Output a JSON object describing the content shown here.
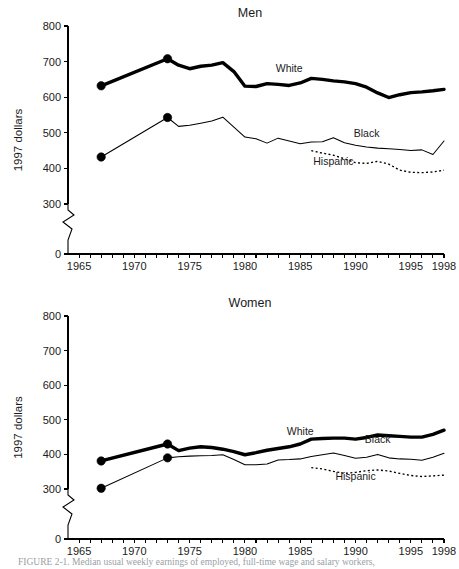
{
  "figure": {
    "caption": "FIGURE 2-1.  Median usual weekly earnings of employed, full-time wage and salary workers,"
  },
  "chart_data": [
    {
      "type": "line",
      "title": "Men",
      "xlabel": "",
      "ylabel": "1997 dollars",
      "xlim": [
        1964,
        1998
      ],
      "ylim": [
        0,
        800
      ],
      "yticks": [
        0,
        300,
        400,
        500,
        600,
        700,
        800
      ],
      "ytick_labels": [
        "0",
        "300",
        "400",
        "500",
        "600",
        "700",
        "800"
      ],
      "y_axis_break": true,
      "y_axis_break_between": [
        0,
        300
      ],
      "xticks": [
        1965,
        1966,
        1967,
        1968,
        1969,
        1970,
        1971,
        1972,
        1973,
        1974,
        1975,
        1976,
        1977,
        1978,
        1979,
        1980,
        1981,
        1982,
        1983,
        1984,
        1985,
        1986,
        1987,
        1988,
        1989,
        1990,
        1991,
        1992,
        1993,
        1994,
        1995,
        1996,
        1997,
        1998
      ],
      "xtick_labels_shown": [
        "1965",
        "1970",
        "1975",
        "1980",
        "1985",
        "1990",
        "1995",
        "1998"
      ],
      "grid": false,
      "legend_position": "inline-annotations",
      "series": [
        {
          "name": "White",
          "style": "thick-solid",
          "label_x": 1984,
          "label_y": 672,
          "markers_at": [
            1967,
            1973
          ],
          "x": [
            1967,
            1973,
            1974,
            1975,
            1976,
            1977,
            1978,
            1979,
            1980,
            1981,
            1982,
            1983,
            1984,
            1985,
            1986,
            1987,
            1988,
            1989,
            1990,
            1991,
            1992,
            1993,
            1994,
            1995,
            1996,
            1997,
            1998
          ],
          "values": [
            632,
            708,
            690,
            680,
            687,
            690,
            697,
            672,
            631,
            630,
            638,
            636,
            633,
            640,
            653,
            650,
            646,
            643,
            638,
            628,
            612,
            599,
            607,
            613,
            615,
            618,
            622
          ]
        },
        {
          "name": "Black",
          "style": "thin-solid",
          "label_x": 1991,
          "label_y": 487,
          "markers_at": [
            1967,
            1973
          ],
          "x": [
            1967,
            1973,
            1974,
            1975,
            1976,
            1977,
            1978,
            1979,
            1980,
            1981,
            1982,
            1983,
            1984,
            1985,
            1986,
            1987,
            1988,
            1989,
            1990,
            1991,
            1992,
            1993,
            1994,
            1995,
            1996,
            1997,
            1998
          ],
          "values": [
            432,
            543,
            518,
            521,
            527,
            533,
            544,
            516,
            488,
            483,
            471,
            485,
            477,
            469,
            474,
            475,
            486,
            472,
            465,
            460,
            457,
            455,
            453,
            450,
            452,
            439,
            477
          ]
        },
        {
          "name": "Hispanic",
          "style": "dotted",
          "label_x": 1988,
          "label_y": 410,
          "markers_at": [],
          "x": [
            1986,
            1987,
            1988,
            1989,
            1990,
            1991,
            1992,
            1993,
            1994,
            1995,
            1996,
            1997,
            1998
          ],
          "values": [
            450,
            443,
            437,
            427,
            416,
            414,
            420,
            412,
            395,
            389,
            388,
            390,
            395
          ]
        }
      ]
    },
    {
      "type": "line",
      "title": "Women",
      "xlabel": "",
      "ylabel": "1997 dollars",
      "xlim": [
        1964,
        1998
      ],
      "ylim": [
        0,
        800
      ],
      "yticks": [
        0,
        300,
        400,
        500,
        600,
        700,
        800
      ],
      "ytick_labels": [
        "0",
        "300",
        "400",
        "500",
        "600",
        "700",
        "800"
      ],
      "y_axis_break": true,
      "y_axis_break_between": [
        0,
        300
      ],
      "xticks": [
        1965,
        1966,
        1967,
        1968,
        1969,
        1970,
        1971,
        1972,
        1973,
        1974,
        1975,
        1976,
        1977,
        1978,
        1979,
        1980,
        1981,
        1982,
        1983,
        1984,
        1985,
        1986,
        1987,
        1988,
        1989,
        1990,
        1991,
        1992,
        1993,
        1994,
        1995,
        1996,
        1997,
        1998
      ],
      "xtick_labels_shown": [
        "1965",
        "1970",
        "1975",
        "1980",
        "1985",
        "1990",
        "1995",
        "1998"
      ],
      "grid": false,
      "legend_position": "inline-annotations",
      "series": [
        {
          "name": "White",
          "style": "thick-solid",
          "label_x": 1985,
          "label_y": 455,
          "markers_at": [
            1967,
            1973
          ],
          "x": [
            1967,
            1973,
            1974,
            1975,
            1976,
            1977,
            1978,
            1979,
            1980,
            1981,
            1982,
            1983,
            1984,
            1985,
            1986,
            1987,
            1988,
            1989,
            1990,
            1991,
            1992,
            1993,
            1994,
            1995,
            1996,
            1997,
            1998
          ],
          "values": [
            381,
            430,
            411,
            418,
            422,
            420,
            415,
            408,
            399,
            405,
            412,
            417,
            422,
            430,
            444,
            446,
            447,
            447,
            444,
            449,
            456,
            454,
            452,
            450,
            450,
            458,
            470
          ]
        },
        {
          "name": "Black",
          "style": "thin-solid",
          "label_x": 1992,
          "label_y": 432,
          "markers_at": [
            1967,
            1973
          ],
          "x": [
            1967,
            1973,
            1974,
            1975,
            1976,
            1977,
            1978,
            1979,
            1980,
            1981,
            1982,
            1983,
            1984,
            1985,
            1986,
            1987,
            1988,
            1989,
            1990,
            1991,
            1992,
            1993,
            1994,
            1995,
            1996,
            1997,
            1998
          ],
          "values": [
            302,
            390,
            393,
            395,
            396,
            397,
            399,
            385,
            370,
            370,
            372,
            384,
            385,
            387,
            394,
            399,
            404,
            397,
            389,
            392,
            400,
            390,
            387,
            386,
            383,
            392,
            403
          ]
        },
        {
          "name": "Hispanic",
          "style": "dotted",
          "label_x": 1990,
          "label_y": 325,
          "markers_at": [],
          "x": [
            1986,
            1987,
            1988,
            1989,
            1990,
            1991,
            1992,
            1993,
            1994,
            1995,
            1996,
            1997,
            1998
          ],
          "values": [
            362,
            358,
            351,
            345,
            348,
            353,
            355,
            352,
            345,
            339,
            336,
            338,
            340
          ]
        }
      ]
    }
  ]
}
